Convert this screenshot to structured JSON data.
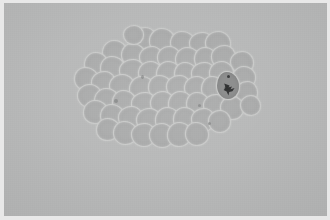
{
  "image": {
    "kind": "micrograph",
    "subject": "cell-cluster",
    "caption": "",
    "width_px": 330,
    "height_px": 220,
    "colors": {
      "frame": "#e8e8e8",
      "background": "#b7b8b8",
      "cell_body": "#a9aaaa",
      "cell_border": "#c9cac9",
      "stained_cell_body": "#8e8f8f",
      "nucleus": "#2e2f30",
      "speck": "#6e6f6f"
    },
    "frame_inset_px": {
      "left": 4,
      "top": 3,
      "right": 3,
      "bottom": 4
    }
  },
  "cluster": {
    "name": "cell-cluster",
    "bounds_px": {
      "x": 75,
      "y": 27,
      "width": 182,
      "height": 123
    },
    "cell_count": 57,
    "stained_cell_count": 1,
    "cells": [
      {
        "id": 1,
        "x": 133,
        "y": 28,
        "w": 23,
        "h": 21,
        "v": "v1",
        "dark": false
      },
      {
        "id": 2,
        "x": 150,
        "y": 29,
        "w": 24,
        "h": 23,
        "v": "v2",
        "dark": false
      },
      {
        "id": 3,
        "x": 171,
        "y": 32,
        "w": 24,
        "h": 22,
        "v": "v3",
        "dark": false
      },
      {
        "id": 4,
        "x": 190,
        "y": 33,
        "w": 23,
        "h": 22,
        "v": "v4",
        "dark": false
      },
      {
        "id": 5,
        "x": 206,
        "y": 32,
        "w": 24,
        "h": 23,
        "v": "v1",
        "dark": false
      },
      {
        "id": 6,
        "x": 103,
        "y": 41,
        "w": 23,
        "h": 22,
        "v": "v2",
        "dark": false
      },
      {
        "id": 7,
        "x": 122,
        "y": 44,
        "w": 23,
        "h": 22,
        "v": "v3",
        "dark": false
      },
      {
        "id": 8,
        "x": 140,
        "y": 47,
        "w": 22,
        "h": 22,
        "v": "v4",
        "dark": false
      },
      {
        "id": 9,
        "x": 158,
        "y": 47,
        "w": 22,
        "h": 22,
        "v": "v1",
        "dark": false
      },
      {
        "id": 10,
        "x": 176,
        "y": 48,
        "w": 23,
        "h": 22,
        "v": "v2",
        "dark": false
      },
      {
        "id": 11,
        "x": 195,
        "y": 48,
        "w": 22,
        "h": 22,
        "v": "v3",
        "dark": false
      },
      {
        "id": 12,
        "x": 212,
        "y": 46,
        "w": 23,
        "h": 23,
        "v": "v4",
        "dark": false
      },
      {
        "id": 13,
        "x": 231,
        "y": 52,
        "w": 22,
        "h": 21,
        "v": "v1",
        "dark": false
      },
      {
        "id": 14,
        "x": 85,
        "y": 53,
        "w": 22,
        "h": 22,
        "v": "v2",
        "dark": false
      },
      {
        "id": 15,
        "x": 101,
        "y": 57,
        "w": 24,
        "h": 23,
        "v": "v3",
        "dark": false
      },
      {
        "id": 16,
        "x": 120,
        "y": 60,
        "w": 24,
        "h": 23,
        "v": "v4",
        "dark": false
      },
      {
        "id": 17,
        "x": 139,
        "y": 62,
        "w": 23,
        "h": 23,
        "v": "v1",
        "dark": false
      },
      {
        "id": 18,
        "x": 157,
        "y": 62,
        "w": 23,
        "h": 23,
        "v": "v2",
        "dark": false
      },
      {
        "id": 19,
        "x": 175,
        "y": 63,
        "w": 22,
        "h": 22,
        "v": "v3",
        "dark": false
      },
      {
        "id": 20,
        "x": 192,
        "y": 63,
        "w": 23,
        "h": 23,
        "v": "v4",
        "dark": false
      },
      {
        "id": 21,
        "x": 210,
        "y": 62,
        "w": 23,
        "h": 23,
        "v": "v1",
        "dark": false
      },
      {
        "id": 22,
        "x": 233,
        "y": 67,
        "w": 22,
        "h": 22,
        "v": "v2",
        "dark": false
      },
      {
        "id": 23,
        "x": 75,
        "y": 68,
        "w": 23,
        "h": 22,
        "v": "v3",
        "dark": false
      },
      {
        "id": 24,
        "x": 92,
        "y": 72,
        "w": 23,
        "h": 23,
        "v": "v4",
        "dark": false
      },
      {
        "id": 25,
        "x": 110,
        "y": 75,
        "w": 24,
        "h": 23,
        "v": "v1",
        "dark": false
      },
      {
        "id": 26,
        "x": 130,
        "y": 77,
        "w": 24,
        "h": 23,
        "v": "v2",
        "dark": false
      },
      {
        "id": 27,
        "x": 149,
        "y": 76,
        "w": 23,
        "h": 23,
        "v": "v3",
        "dark": false
      },
      {
        "id": 28,
        "x": 167,
        "y": 76,
        "w": 23,
        "h": 23,
        "v": "v4",
        "dark": false
      },
      {
        "id": 29,
        "x": 185,
        "y": 77,
        "w": 23,
        "h": 23,
        "v": "v1",
        "dark": false
      },
      {
        "id": 30,
        "x": 202,
        "y": 77,
        "w": 21,
        "h": 22,
        "v": "v2",
        "dark": false
      },
      {
        "id": 31,
        "x": 217,
        "y": 72,
        "w": 22,
        "h": 27,
        "v": "v3",
        "dark": true
      },
      {
        "id": 32,
        "x": 236,
        "y": 82,
        "w": 21,
        "h": 22,
        "v": "v4",
        "dark": false
      },
      {
        "id": 33,
        "x": 78,
        "y": 85,
        "w": 23,
        "h": 22,
        "v": "v1",
        "dark": false
      },
      {
        "id": 34,
        "x": 95,
        "y": 89,
        "w": 23,
        "h": 22,
        "v": "v2",
        "dark": false
      },
      {
        "id": 35,
        "x": 113,
        "y": 91,
        "w": 23,
        "h": 23,
        "v": "v3",
        "dark": false
      },
      {
        "id": 36,
        "x": 132,
        "y": 93,
        "w": 24,
        "h": 23,
        "v": "v4",
        "dark": false
      },
      {
        "id": 37,
        "x": 151,
        "y": 92,
        "w": 23,
        "h": 23,
        "v": "v1",
        "dark": false
      },
      {
        "id": 38,
        "x": 169,
        "y": 92,
        "w": 23,
        "h": 23,
        "v": "v2",
        "dark": false
      },
      {
        "id": 39,
        "x": 187,
        "y": 93,
        "w": 22,
        "h": 22,
        "v": "v3",
        "dark": false
      },
      {
        "id": 40,
        "x": 204,
        "y": 95,
        "w": 22,
        "h": 22,
        "v": "v4",
        "dark": false
      },
      {
        "id": 41,
        "x": 221,
        "y": 97,
        "w": 22,
        "h": 22,
        "v": "v1",
        "dark": false
      },
      {
        "id": 42,
        "x": 84,
        "y": 101,
        "w": 23,
        "h": 22,
        "v": "v2",
        "dark": false
      },
      {
        "id": 43,
        "x": 101,
        "y": 105,
        "w": 23,
        "h": 22,
        "v": "v3",
        "dark": false
      },
      {
        "id": 44,
        "x": 119,
        "y": 107,
        "w": 23,
        "h": 23,
        "v": "v4",
        "dark": false
      },
      {
        "id": 45,
        "x": 137,
        "y": 109,
        "w": 24,
        "h": 23,
        "v": "v1",
        "dark": false
      },
      {
        "id": 46,
        "x": 156,
        "y": 108,
        "w": 23,
        "h": 23,
        "v": "v2",
        "dark": false
      },
      {
        "id": 47,
        "x": 174,
        "y": 108,
        "w": 23,
        "h": 23,
        "v": "v3",
        "dark": false
      },
      {
        "id": 48,
        "x": 192,
        "y": 109,
        "w": 22,
        "h": 22,
        "v": "v4",
        "dark": false
      },
      {
        "id": 49,
        "x": 209,
        "y": 111,
        "w": 21,
        "h": 21,
        "v": "v1",
        "dark": false
      },
      {
        "id": 50,
        "x": 97,
        "y": 119,
        "w": 22,
        "h": 21,
        "v": "v2",
        "dark": false
      },
      {
        "id": 51,
        "x": 114,
        "y": 122,
        "w": 23,
        "h": 22,
        "v": "v3",
        "dark": false
      },
      {
        "id": 52,
        "x": 132,
        "y": 124,
        "w": 23,
        "h": 22,
        "v": "v4",
        "dark": false
      },
      {
        "id": 53,
        "x": 150,
        "y": 124,
        "w": 23,
        "h": 23,
        "v": "v1",
        "dark": false
      },
      {
        "id": 54,
        "x": 168,
        "y": 123,
        "w": 23,
        "h": 23,
        "v": "v2",
        "dark": false
      },
      {
        "id": 55,
        "x": 186,
        "y": 123,
        "w": 22,
        "h": 22,
        "v": "v3",
        "dark": false
      },
      {
        "id": 56,
        "x": 124,
        "y": 26,
        "w": 19,
        "h": 18,
        "v": "v4",
        "dark": false
      },
      {
        "id": 57,
        "x": 241,
        "y": 96,
        "w": 19,
        "h": 19,
        "v": "v1",
        "dark": false
      }
    ],
    "specks": [
      {
        "id": 1,
        "x": 141,
        "y": 75,
        "w": 3,
        "h": 4
      },
      {
        "id": 2,
        "x": 114,
        "y": 99,
        "w": 4,
        "h": 4
      },
      {
        "id": 3,
        "x": 208,
        "y": 122,
        "w": 3,
        "h": 3
      },
      {
        "id": 4,
        "x": 198,
        "y": 104,
        "w": 3,
        "h": 3
      }
    ],
    "stained_cell": {
      "name": "stained-cell",
      "body_px": {
        "x": 217,
        "y": 72,
        "width": 22,
        "height": 27
      },
      "nucleus_px": {
        "x": 223,
        "y": 83,
        "width": 13,
        "height": 13
      },
      "dot_px": {
        "x": 227,
        "y": 75,
        "width": 3,
        "height": 3
      }
    }
  }
}
